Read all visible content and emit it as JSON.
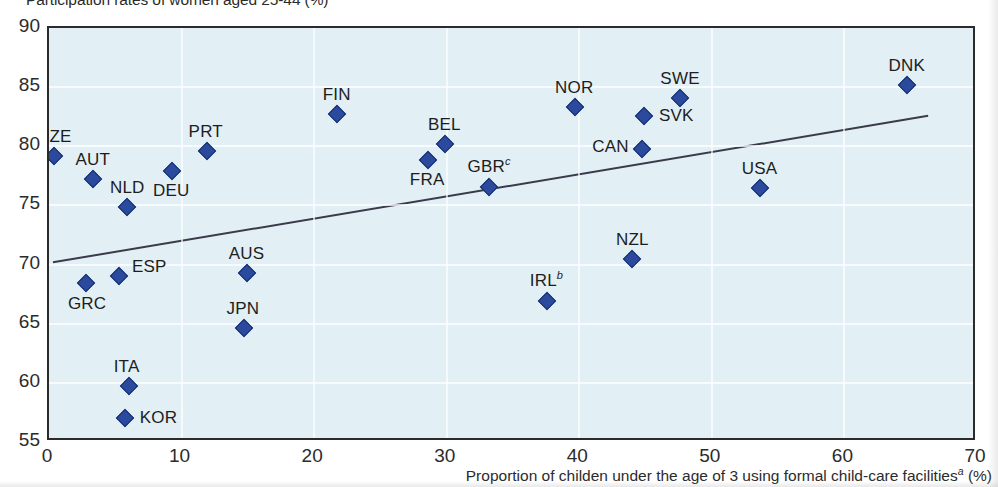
{
  "chart_data": {
    "type": "scatter",
    "title": "Participation rates of women aged 25-44 (%)",
    "xlabel": "Proportion of childen under the age of 3 using formal child-care facilities",
    "xlabel_sup": "a",
    "xlabel_unit": "(%)",
    "ylabel": "",
    "xlim": [
      0,
      70
    ],
    "ylim": [
      55,
      90
    ],
    "xticks": [
      "0",
      "10",
      "20",
      "30",
      "40",
      "50",
      "60",
      "70"
    ],
    "xtick_values": [
      0,
      10,
      20,
      30,
      40,
      50,
      60,
      70
    ],
    "yticks": [
      "90",
      "85",
      "80",
      "75",
      "70",
      "65",
      "60",
      "55"
    ],
    "ytick_values": [
      90,
      85,
      80,
      75,
      70,
      65,
      60,
      55
    ],
    "grid": true,
    "legend": "none",
    "marker_color": "#2b4a9e",
    "plot_background": "#e2eff5",
    "axis_color": "#2b2b2b",
    "trendline": {
      "label": "linear fit",
      "x0": 0.3,
      "y0": 70.0,
      "x1": 66.6,
      "y1": 82.5,
      "color": "#3a3a4a"
    },
    "points": [
      {
        "code": "CZE",
        "sup": "",
        "x": 0.4,
        "y": 79.2,
        "label_dx": 0,
        "label_dy": -19
      },
      {
        "code": "GRC",
        "sup": "",
        "x": 2.8,
        "y": 68.4,
        "label_dx": 1,
        "label_dy": 21
      },
      {
        "code": "AUT",
        "sup": "",
        "x": 3.3,
        "y": 77.2,
        "label_dx": 0,
        "label_dy": -19
      },
      {
        "code": "ESP",
        "sup": "",
        "x": 5.3,
        "y": 69.0,
        "label_dx": 30,
        "label_dy": -9
      },
      {
        "code": "NLD",
        "sup": "",
        "x": 5.9,
        "y": 74.9,
        "label_dx": 0,
        "label_dy": -19
      },
      {
        "code": "KOR",
        "sup": "",
        "x": 5.7,
        "y": 57.0,
        "label_dx": 34,
        "label_dy": 0
      },
      {
        "code": "ITA",
        "sup": "",
        "x": 6.0,
        "y": 59.7,
        "label_dx": -2,
        "label_dy": -19
      },
      {
        "code": "DEU",
        "sup": "",
        "x": 9.3,
        "y": 77.9,
        "label_dx": -1,
        "label_dy": 20
      },
      {
        "code": "PRT",
        "sup": "",
        "x": 11.9,
        "y": 79.6,
        "label_dx": -1,
        "label_dy": -19
      },
      {
        "code": "JPN",
        "sup": "",
        "x": 14.7,
        "y": 64.6,
        "label_dx": -1,
        "label_dy": -19
      },
      {
        "code": "AUS",
        "sup": "",
        "x": 14.9,
        "y": 69.3,
        "label_dx": 0,
        "label_dy": -19
      },
      {
        "code": "FIN",
        "sup": "",
        "x": 21.7,
        "y": 82.7,
        "label_dx": 0,
        "label_dy": -19
      },
      {
        "code": "FRA",
        "sup": "",
        "x": 28.6,
        "y": 78.8,
        "label_dx": -1,
        "label_dy": 20
      },
      {
        "code": "BEL",
        "sup": "",
        "x": 29.9,
        "y": 80.2,
        "label_dx": -1,
        "label_dy": -19
      },
      {
        "code": "GBR",
        "sup": "c",
        "x": 33.2,
        "y": 76.6,
        "label_dx": 0,
        "label_dy": -20
      },
      {
        "code": "IRL",
        "sup": "b",
        "x": 37.6,
        "y": 66.9,
        "label_dx": -1,
        "label_dy": -20
      },
      {
        "code": "NOR",
        "sup": "",
        "x": 39.7,
        "y": 83.3,
        "label_dx": -1,
        "label_dy": -19
      },
      {
        "code": "CAN",
        "sup": "",
        "x": 44.7,
        "y": 79.8,
        "label_dx": -31,
        "label_dy": -2
      },
      {
        "code": "SVK",
        "sup": "",
        "x": 44.9,
        "y": 82.6,
        "label_dx": 32,
        "label_dy": 0
      },
      {
        "code": "SWE",
        "sup": "",
        "x": 47.6,
        "y": 84.1,
        "label_dx": 0,
        "label_dy": -19
      },
      {
        "code": "USA",
        "sup": "",
        "x": 53.6,
        "y": 76.5,
        "label_dx": 0,
        "label_dy": -19
      },
      {
        "code": "NZL",
        "sup": "",
        "x": 44.0,
        "y": 70.5,
        "label_dx": 0,
        "label_dy": -19
      },
      {
        "code": "DNK",
        "sup": "",
        "x": 64.7,
        "y": 85.2,
        "label_dx": 0,
        "label_dy": -19
      }
    ]
  }
}
